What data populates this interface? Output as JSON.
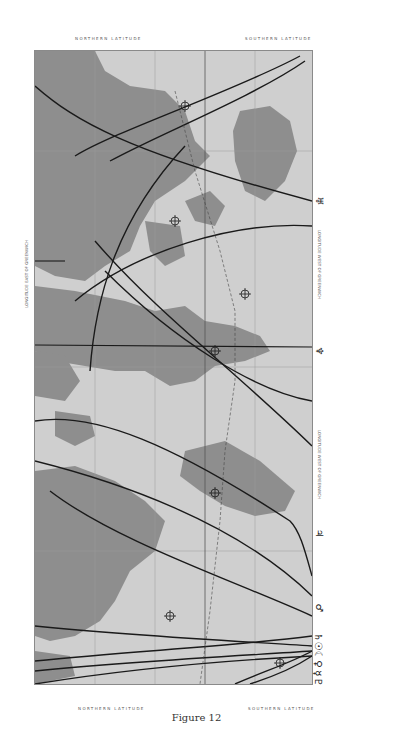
{
  "figure": {
    "caption": "Figure 12",
    "orientation": "rotated 90deg clockwise (north to the left)"
  },
  "map": {
    "top_labels": {
      "north": "NORTHERN LATITUDE",
      "south": "SOUTHERN LATITUDE"
    },
    "bottom_labels": {
      "north": "NORTHERN LATITUDE",
      "south": "SOUTHERN LATITUDE"
    },
    "left_edge_label": "LONGITUDE EAST OF GREENWICH",
    "right_edge_label": "LONGITUDE WEST OF GREENWICH",
    "latitude_ticks": [
      "60°",
      "40°",
      "20°",
      "0°",
      "20°",
      "40°"
    ],
    "longitude_ticks_left": [
      "180",
      "160",
      "140",
      "120",
      "100",
      "80",
      "60",
      "40",
      "20",
      "0",
      "20",
      "40",
      "60",
      "80",
      "100",
      "120",
      "140",
      "160",
      "180"
    ],
    "longitude_ticks_right": [
      "180",
      "160",
      "140",
      "120",
      "100",
      "80",
      "60",
      "40",
      "20",
      "0",
      "20",
      "40",
      "60",
      "80",
      "100",
      "120",
      "140",
      "160",
      "180"
    ],
    "ocean_labels": [
      "PACIFIC OCEAN",
      "ATLANTIC OCEAN",
      "ATLANTIC OCEAN",
      "INDIAN OCEAN",
      "PACIFIC OCEAN"
    ],
    "continents": [
      "Asia",
      "Europe",
      "Africa",
      "Australia",
      "North America",
      "South America"
    ],
    "colors": {
      "land": "#8e8e8e",
      "ocean": "#cfcfcf",
      "lines": "#1a1a1a",
      "grid": "#9a9a9a"
    }
  },
  "planet_lines": [
    {
      "symbol": "♅",
      "name": "Uranus"
    },
    {
      "symbol": "♆",
      "name": "Neptune"
    },
    {
      "symbol": "♃",
      "name": "Jupiter"
    },
    {
      "symbol": "♂",
      "name": "Mars"
    },
    {
      "symbol": "♄",
      "name": "Saturn"
    },
    {
      "symbol": "☉",
      "name": "Sun"
    },
    {
      "symbol": "☾",
      "name": "Moon"
    },
    {
      "symbol": "♀",
      "name": "Venus"
    },
    {
      "symbol": "☿",
      "name": "Mercury"
    },
    {
      "symbol": "♇",
      "name": "Pluto"
    }
  ]
}
